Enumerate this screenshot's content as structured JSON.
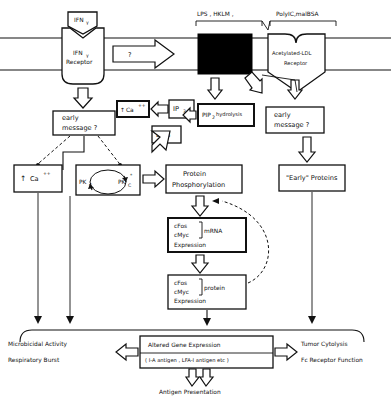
{
  "figure": {
    "kind": "signal-transduction-diagram",
    "membrane": {
      "label": "plasma membrane bilayer (two horizontal lines)"
    }
  },
  "ligands": {
    "ifn": "IFN",
    "ifn_sub": "γ",
    "lps": "LPS , HKLM ,",
    "polyic": "PolyIC,malBSA"
  },
  "receptors": {
    "ifn_receptor_line1": "IFN",
    "ifn_receptor_sub": "γ",
    "ifn_receptor_line2": "Receptor",
    "black_box": "",
    "ldl_line1": "Acetylated-LDL",
    "ldl_line2": "Receptor"
  },
  "arrows": {
    "question": "?"
  },
  "nodes": {
    "early_message_left_l1": "early",
    "early_message_left_l2": "message ?",
    "early_message_right_l1": "early",
    "early_message_right_l2": "message ?",
    "ca_arrow": "↑",
    "ca": "Ca",
    "ca_sup": "++",
    "ip3": "IP",
    "ip3_sub": "3",
    "dag": "DAG",
    "pip2": "PIP",
    "pip2_sub": "2",
    "pip2_hydrolysis": "PIP",
    "pip2_hydrolysis_sub": "2",
    "pip2_hydrolysis_rest": "hydrolysis",
    "ca_box_arrow": "↑",
    "ca_box": "Ca",
    "ca_box_sup": "++",
    "pkc_inactive": "PK",
    "pkc_inactive_sub": "C",
    "pkc_active": "PK",
    "pkc_active_sub": "C",
    "pkc_active_star": "*",
    "protein_phos_l1": "Protein",
    "protein_phos_l2": "Phosphorylation",
    "early_proteins": "\"Early\" Proteins",
    "mrna_l1": "cFos",
    "mrna_l2": "cMyc",
    "mrna_bracket": "mRNA",
    "mrna_l3": "Expression",
    "protein_l1": "cFos",
    "protein_l2": "cMyc",
    "protein_bracket": "protein",
    "protein_l3": "Expression",
    "altered_gene": "Altered  Gene  Expression",
    "altered_gene_sub": "( I-A antigen , LFA-I antigen etc )"
  },
  "outcomes": {
    "left_1": "Microbicidal  Activity",
    "left_2": "Respiratory Burst",
    "right_1": "Tumor Cytolysis",
    "right_2": "Fc Receptor Function",
    "bottom": "Antigen  Presentation"
  }
}
